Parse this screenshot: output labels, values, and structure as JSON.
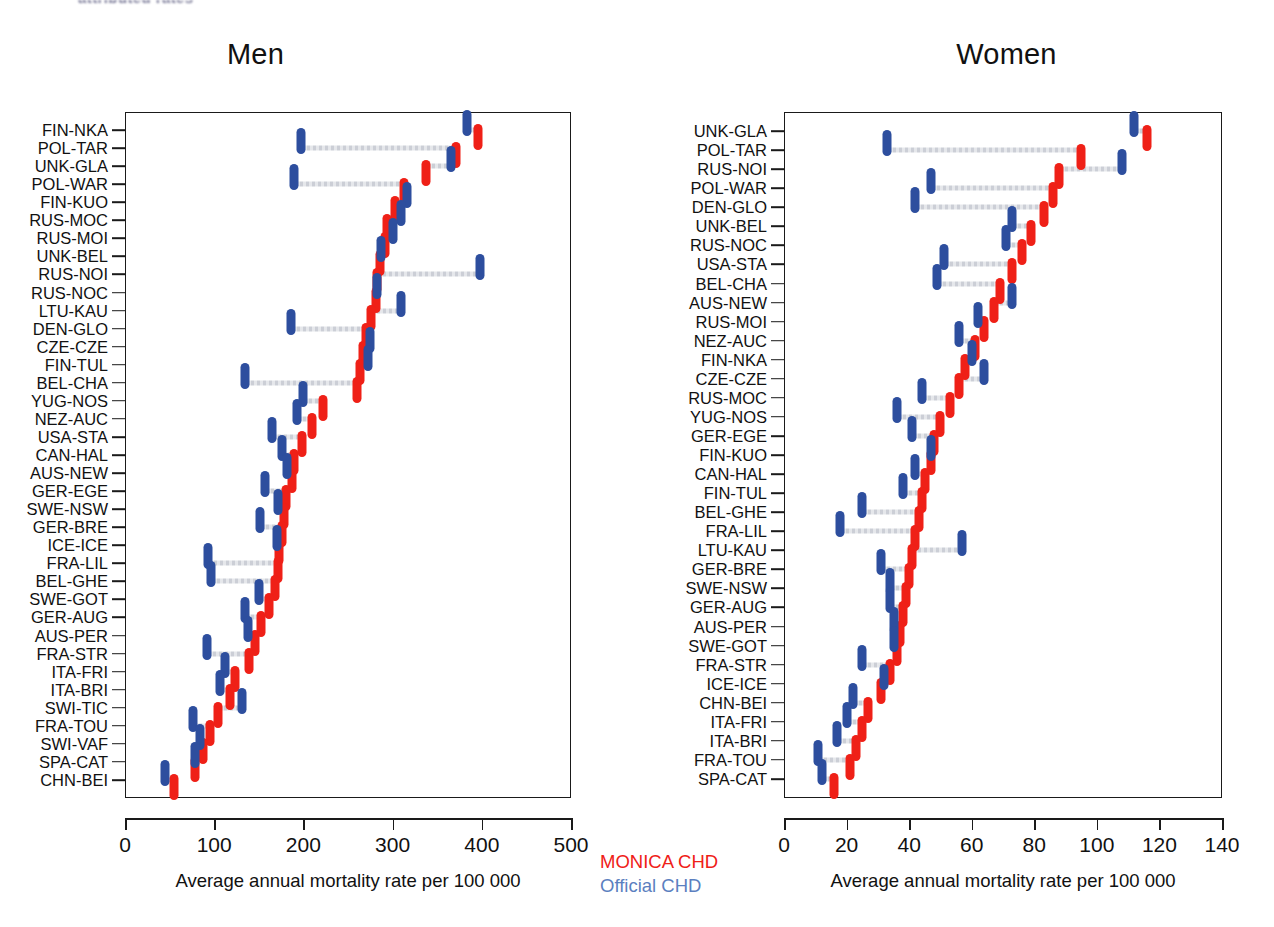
{
  "page": {
    "top_fragment": "attributed rates"
  },
  "legend": {
    "monica_label": "MONICA CHD",
    "official_label": "Official CHD",
    "monica_color": "#ef2017",
    "official_color": "#5b7fc0"
  },
  "panels": [
    {
      "id": "men",
      "title": "Men",
      "axis_title": "Average annual mortality rate per 100 000"
    },
    {
      "id": "women",
      "title": "Women",
      "axis_title": "Average annual mortality rate per 100 000"
    }
  ],
  "chart_data": [
    {
      "type": "scatter",
      "title": "Men",
      "xlabel": "Average annual mortality rate per 100 000",
      "ylabel": "",
      "xlim": [
        0,
        500
      ],
      "xticks": [
        0,
        100,
        200,
        300,
        400,
        500
      ],
      "grid": false,
      "legend_position": "bottom-right",
      "series": [
        {
          "name": "Official CHD",
          "color": "#2d4e9e"
        },
        {
          "name": "MONICA CHD",
          "color": "#ef2017"
        }
      ],
      "categories": [
        "FIN-NKA",
        "POL-TAR",
        "UNK-GLA",
        "POL-WAR",
        "FIN-KUO",
        "RUS-MOC",
        "RUS-MOI",
        "UNK-BEL",
        "RUS-NOI",
        "RUS-NOC",
        "LTU-KAU",
        "DEN-GLO",
        "CZE-CZE",
        "FIN-TUL",
        "BEL-CHA",
        "YUG-NOS",
        "NEZ-AUC",
        "USA-STA",
        "CAN-HAL",
        "AUS-NEW",
        "GER-EGE",
        "SWE-NSW",
        "GER-BRE",
        "ICE-ICE",
        "FRA-LIL",
        "BEL-GHE",
        "SWE-GOT",
        "GER-AUG",
        "AUS-PER",
        "FRA-STR",
        "ITA-FRI",
        "ITA-BRI",
        "SWI-TIC",
        "FRA-TOU",
        "SWI-VAF",
        "SPA-CAT",
        "CHN-BEI"
      ],
      "official_values": [
        383,
        197,
        366,
        190,
        316,
        309,
        300,
        287,
        398,
        282,
        309,
        186,
        275,
        272,
        135,
        200,
        193,
        165,
        176,
        182,
        157,
        172,
        151,
        170,
        93,
        96,
        150,
        135,
        138,
        92,
        112,
        107,
        131,
        76,
        84,
        78,
        45
      ],
      "monica_values": [
        396,
        371,
        337,
        313,
        303,
        294,
        291,
        286,
        283,
        281,
        276,
        270,
        267,
        263,
        260,
        222,
        210,
        198,
        190,
        187,
        180,
        178,
        176,
        173,
        171,
        168,
        161,
        153,
        146,
        139,
        123,
        118,
        104,
        95,
        88,
        78,
        55
      ]
    },
    {
      "type": "scatter",
      "title": "Women",
      "xlabel": "Average annual mortality rate per 100 000",
      "ylabel": "",
      "xlim": [
        0,
        140
      ],
      "xticks": [
        0,
        20,
        40,
        60,
        80,
        100,
        120,
        140
      ],
      "grid": false,
      "legend_position": "none",
      "categories": [
        "UNK-GLA",
        "POL-TAR",
        "RUS-NOI",
        "POL-WAR",
        "DEN-GLO",
        "UNK-BEL",
        "RUS-NOC",
        "USA-STA",
        "BEL-CHA",
        "AUS-NEW",
        "RUS-MOI",
        "NEZ-AUC",
        "FIN-NKA",
        "CZE-CZE",
        "RUS-MOC",
        "YUG-NOS",
        "GER-EGE",
        "FIN-KUO",
        "CAN-HAL",
        "FIN-TUL",
        "BEL-GHE",
        "FRA-LIL",
        "LTU-KAU",
        "GER-BRE",
        "SWE-NSW",
        "GER-AUG",
        "AUS-PER",
        "SWE-GOT",
        "FRA-STR",
        "ICE-ICE",
        "CHN-BEI",
        "ITA-FRI",
        "ITA-BRI",
        "FRA-TOU",
        "SPA-CAT"
      ],
      "official_values": [
        112,
        33,
        108,
        47,
        42,
        73,
        71,
        51,
        49,
        73,
        62,
        56,
        60,
        64,
        44,
        36,
        41,
        47,
        42,
        38,
        25,
        18,
        57,
        31,
        34,
        34,
        35,
        35,
        25,
        32,
        22,
        20,
        17,
        11,
        12
      ],
      "monica_values": [
        116,
        95,
        88,
        86,
        83,
        79,
        76,
        73,
        69,
        67,
        64,
        61,
        58,
        56,
        53,
        50,
        48,
        47,
        45,
        44,
        43,
        42,
        41,
        40,
        39,
        38,
        37,
        36,
        34,
        31,
        27,
        25,
        23,
        21,
        16
      ]
    }
  ]
}
